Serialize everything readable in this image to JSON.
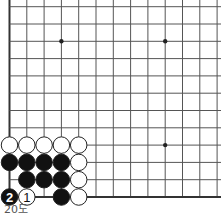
{
  "diagram": {
    "caption": "20도",
    "grid": {
      "x0": 9.5,
      "y_bottom": 197,
      "spacing": 17.3,
      "cols": 13,
      "rows_above_bottom": 12,
      "line_color": "#555555",
      "edge_color": "#333333"
    },
    "star_points": [
      {
        "col": 3,
        "row": 9
      },
      {
        "col": 9,
        "row": 9
      },
      {
        "col": 9,
        "row": 3
      }
    ],
    "stones": [
      {
        "col": 0,
        "row": 3,
        "color": "white"
      },
      {
        "col": 1,
        "row": 3,
        "color": "white"
      },
      {
        "col": 2,
        "row": 3,
        "color": "white"
      },
      {
        "col": 3,
        "row": 3,
        "color": "white"
      },
      {
        "col": 4,
        "row": 3,
        "color": "white"
      },
      {
        "col": 0,
        "row": 2,
        "color": "black"
      },
      {
        "col": 1,
        "row": 2,
        "color": "black"
      },
      {
        "col": 2,
        "row": 2,
        "color": "black"
      },
      {
        "col": 3,
        "row": 2,
        "color": "black"
      },
      {
        "col": 4,
        "row": 2,
        "color": "white"
      },
      {
        "col": 1,
        "row": 1,
        "color": "black"
      },
      {
        "col": 2,
        "row": 1,
        "color": "black"
      },
      {
        "col": 3,
        "row": 1,
        "color": "black"
      },
      {
        "col": 4,
        "row": 1,
        "color": "white"
      },
      {
        "col": 0,
        "row": 0,
        "color": "black",
        "label": "2"
      },
      {
        "col": 1,
        "row": 0,
        "color": "white",
        "label": "1"
      },
      {
        "col": 3,
        "row": 0,
        "color": "black"
      },
      {
        "col": 4,
        "row": 0,
        "color": "white"
      }
    ]
  }
}
